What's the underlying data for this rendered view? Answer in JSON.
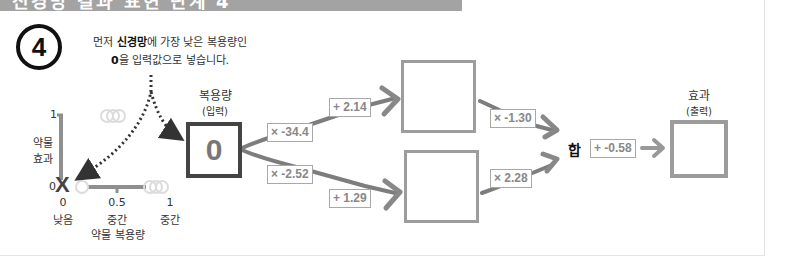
{
  "banner": {
    "text": "신경망 결과 표현 단계 4",
    "color": "#a3a3a3"
  },
  "step": {
    "number": "4"
  },
  "instruction": {
    "line1_pre": "먼저 ",
    "line1_bold": "신경망",
    "line1_post": "에 가장 낮은 복용량인",
    "line2_bold": "0",
    "line2_post": "을 입력값으로 넣습니다."
  },
  "left_graph": {
    "y_axis_label_1": "약물",
    "y_axis_label_2": "효과",
    "y_tick_top": "1",
    "y_tick_bottom": "0",
    "x_ticks": [
      "0",
      "0.5",
      "1"
    ],
    "x_tick_labels": [
      "낮음",
      "중간",
      "중간"
    ],
    "x_axis_label": "약물 복용량",
    "marker": "X"
  },
  "input_node": {
    "title": "복용량",
    "subtitle": "(입력)",
    "value": "0"
  },
  "weights": {
    "top_in": "× -34.4",
    "bottom_in": "× -2.52",
    "top_bias": "+ 2.14",
    "bottom_bias": "+ 1.29",
    "top_out": "× -1.30",
    "bottom_out": "× 2.28",
    "final_bias": "+ -0.58"
  },
  "sum_label": "합",
  "output_node": {
    "title": "효과",
    "subtitle": "(출력)",
    "value": ""
  },
  "colors": {
    "arrow": "#8a8a8a",
    "box_border": "#9d9d9d",
    "input_border": "#444444"
  }
}
